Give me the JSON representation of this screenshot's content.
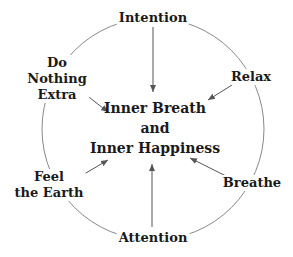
{
  "diagram": {
    "center": {
      "line1": "Inner Breath",
      "line2": "and",
      "line3": "Inner Happiness"
    },
    "nodes": [
      {
        "id": "intention",
        "lines": [
          "Intention"
        ]
      },
      {
        "id": "relax",
        "lines": [
          "Relax"
        ]
      },
      {
        "id": "breathe",
        "lines": [
          "Breathe"
        ]
      },
      {
        "id": "attention",
        "lines": [
          "Attention"
        ]
      },
      {
        "id": "feel-the-earth",
        "lines": [
          "Feel",
          "the Earth"
        ]
      },
      {
        "id": "do-nothing-extra",
        "lines": [
          "Do",
          "Nothing",
          "Extra"
        ]
      }
    ],
    "colors": {
      "line": "#777777",
      "text": "#1a1a1a",
      "background": "#ffffff"
    }
  }
}
